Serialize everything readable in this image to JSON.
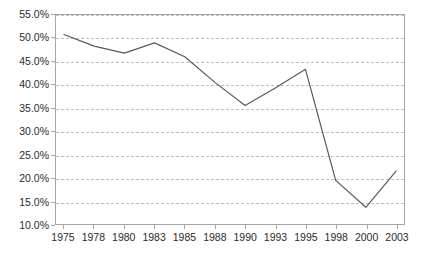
{
  "chart_data": {
    "type": "line",
    "title": "",
    "subtitle": "",
    "xlabel": "",
    "ylabel": "",
    "categories": [
      "1975",
      "1978",
      "1980",
      "1983",
      "1985",
      "1988",
      "1990",
      "1993",
      "1995",
      "1998",
      "2000",
      "2003"
    ],
    "values": [
      50.8,
      48.3,
      46.8,
      49.0,
      46.0,
      40.5,
      35.5,
      39.3,
      43.3,
      19.4,
      13.6,
      21.4
    ],
    "series": [
      {
        "name": "",
        "values": [
          50.8,
          48.3,
          46.8,
          49.0,
          46.0,
          40.5,
          35.5,
          39.3,
          43.3,
          19.4,
          13.6,
          21.4
        ]
      }
    ],
    "ylim": [
      10.0,
      55.0
    ],
    "ytick_values": [
      10.0,
      15.0,
      20.0,
      25.0,
      30.0,
      35.0,
      40.0,
      45.0,
      50.0,
      55.0
    ],
    "ytick_labels": [
      "10.0%",
      "15.0%",
      "20.0%",
      "25.0%",
      "30.0%",
      "35.0%",
      "40.0%",
      "45.0%",
      "50.0%",
      "55.0%"
    ],
    "xtick_labels": [
      "1975",
      "1978",
      "1980",
      "1983",
      "1985",
      "1988",
      "1990",
      "1993",
      "1995",
      "1998",
      "2000",
      "2003"
    ],
    "grid": true,
    "grid_axis": "y",
    "grid_style": "dashed",
    "legend": false,
    "legend_position": "none",
    "value_suffix": "%",
    "markers": false,
    "colors": {
      "line": "#595959",
      "grid": "#bfbfbf",
      "axis": "#a6a6a6",
      "text": "#2b2b2b",
      "background": "#ffffff"
    }
  }
}
